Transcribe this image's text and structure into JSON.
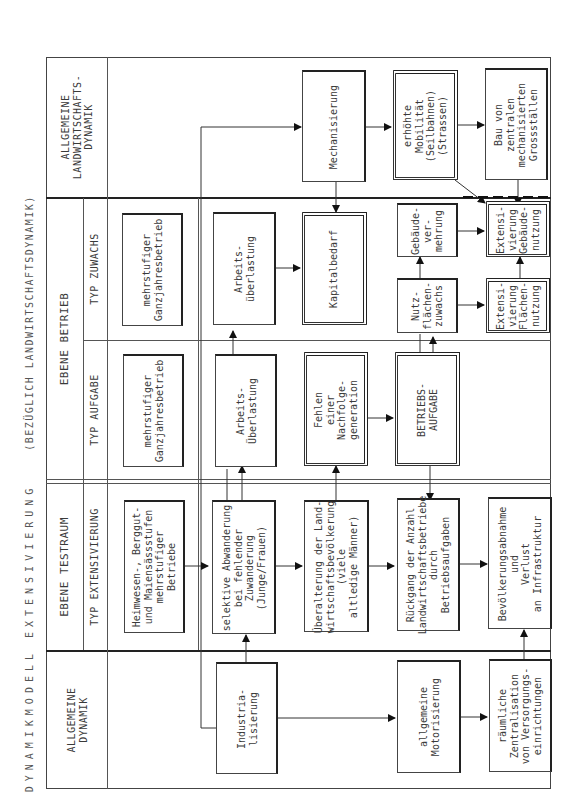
{
  "title": {
    "main": "DYNAMIKMODELL EXTENSIVIERUNG",
    "sub": "(BEZÜGLICH LANDWIRTSCHAFTSDYNAMIK)"
  },
  "lanes": {
    "landwirtschaft": "ALLGEMEINE\nLANDWIRTSCHAFTS-\nDYNAMIK",
    "betrieb": "EBENE BETRIEB",
    "typ_zuwachs": "TYP ZUWACHS",
    "typ_aufgabe": "TYP AUFGABE",
    "testraum": "EBENE TESTRAUM",
    "typ_extensivierung": "TYP EXTENSIVIERUNG",
    "allgemeine": "ALLGEMEINE\nDYNAMIK"
  },
  "boxes": {
    "mechanisierung": "Mechanisierung",
    "mobilitaet": "erhöhte\nMobilität\n(Seilbahnen)\n(Strassen)",
    "grossstaelle": "Bau von\nzentralen\nmechanisierten\nGrossställen",
    "zuwachs_betrieb": "mehrstufiger\nGanzjahresbetrieb",
    "zuwachs_ueberlastung": "Arbeits-\nüberlastung",
    "kapitalbedarf": "Kapitalbedarf",
    "gebaeudevermehrung": "Gebäude-\nver-\nmehrung",
    "ext_gebaeude": "Extensi-\nvierung\nGebäude-\nnutzung",
    "nutzflaechen": "Nutz-\nflächen-\nzuwachs",
    "ext_flaechen": "Extensi-\nvierung\nFlächen-\nnutzung",
    "aufgabe_betrieb": "mehrstufiger\nGanzjahresbetrieb",
    "aufgabe_ueberlastung": "Arbeits-\nÜberlastung",
    "nachfolge": "Fehlen\neiner\nNachfolge-\ngeneration",
    "betriebsaufgabe": "BETRIEBS-\nAUFGABE",
    "heimwesen": "Heimwesen-, Berggut-\nund Maiensässstufen\nmehrstufiger\nBetriebe",
    "abwanderung": "selektive Abwanderung\nbei fehlender\nZuwanderung\n(Junge/Frauen)",
    "ueberalterung": "Überalterung der Land-\nwirtschaftsbevölkerung\n(viele\naltledige Männer)",
    "rueckgang": "Rückgang der Anzahl\nLandwirtschaftsbetriebe\ndurch\nBetriebsaufgaben",
    "bevoelkerung": "Bevölkerungsabnahme\nund\nVerlust\nan Infrastruktur",
    "industrialisierung": "Industria-\nlisierung",
    "motorisierung": "allgemeine\nMotorisierung",
    "zentralisation": "räumliche\nZentralisation\nvon Versorgungs-\neinrichtungen"
  },
  "colors": {
    "line": "#222222",
    "text": "#3a3a3a",
    "background": "#ffffff"
  }
}
